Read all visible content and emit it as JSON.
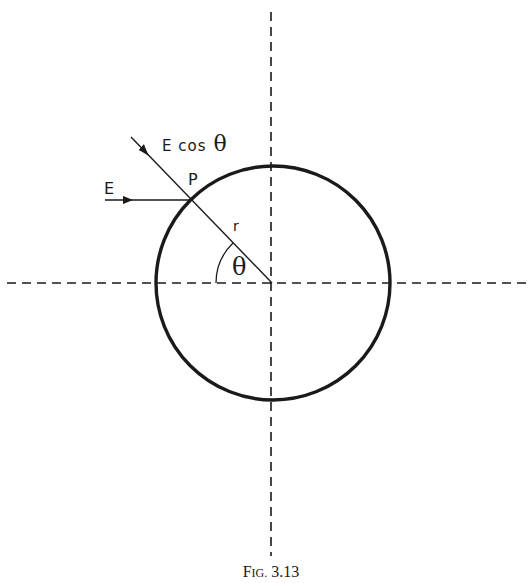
{
  "figure": {
    "caption": "Fig. 3.13",
    "caption_small_caps": {
      "big": "F",
      "small": "IG.",
      "rest": " 3.13"
    }
  },
  "labels": {
    "field": "E",
    "field_component_prefix": "E cos",
    "theta": "θ",
    "point": "P",
    "radius": "r",
    "angle": "θ"
  },
  "geometry": {
    "center": [
      273,
      283
    ],
    "radius": 117,
    "horizontal_axis": {
      "x1": 7,
      "x2": 527,
      "y": 283
    },
    "vertical_axis": {
      "x": 271,
      "y1": 12,
      "y2": 556
    },
    "point_P": [
      190,
      200
    ],
    "radial_line_start": [
      131,
      137
    ]
  },
  "colors": {
    "ink": "#1a1a1a",
    "background": "#ffffff"
  }
}
